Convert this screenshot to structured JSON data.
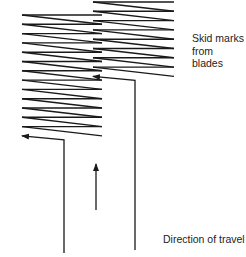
{
  "diagram": {
    "labels": {
      "skid_marks_line1": "Skid marks",
      "skid_marks_line2": "from blades",
      "direction": "Direction of travel"
    },
    "tracks": [
      {
        "name": "left-blade-track",
        "zigzag_count": 13
      },
      {
        "name": "right-blade-track",
        "zigzag_count": 8
      }
    ],
    "stroke_color": "#1a1a1a"
  }
}
